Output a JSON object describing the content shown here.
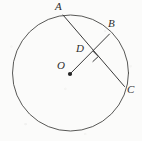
{
  "figure": {
    "type": "circle-geometry-diagram",
    "canvas": {
      "width": 142,
      "height": 141
    },
    "background_color": "#fbfbfa",
    "ink_color": "#3a3a3a",
    "circle": {
      "name": "main-circle",
      "center_label": "O",
      "cx": 70.5,
      "cy": 73.0,
      "r": 58.0,
      "stroke": "#4a4a48",
      "stroke_width": 1.0,
      "fill": "none"
    },
    "center_dot": {
      "name": "center-point-O",
      "cx": 70.0,
      "cy": 74.0,
      "r": 2.0,
      "fill": "#242424"
    },
    "points": [
      {
        "id": "A",
        "label": "A",
        "x": 63.0,
        "y": 15.0,
        "label_x": 55,
        "label_y": 1,
        "on_circle": true
      },
      {
        "id": "B",
        "label": "B",
        "x": 109.0,
        "y": 34.0,
        "label_x": 108,
        "label_y": 18,
        "on_circle": true
      },
      {
        "id": "C",
        "label": "C",
        "x": 124.0,
        "y": 86.0,
        "label_x": 127,
        "label_y": 84,
        "on_circle": true
      },
      {
        "id": "D",
        "label": "D",
        "x": 87.5,
        "y": 56.0,
        "label_x": 76,
        "label_y": 43,
        "on_circle": false
      },
      {
        "id": "O",
        "label": "O",
        "x": 70.0,
        "y": 74.0,
        "label_x": 57,
        "label_y": 60,
        "on_circle": false
      }
    ],
    "segments": [
      {
        "name": "chord-AC",
        "from": "A",
        "to": "C",
        "x1": 63.0,
        "y1": 15.0,
        "x2": 124.5,
        "y2": 86.5,
        "stroke": "#3a3a3a",
        "stroke_width": 1.0
      },
      {
        "name": "radius-OB",
        "from": "O",
        "to": "B",
        "x1": 70.0,
        "y1": 74.0,
        "x2": 109.5,
        "y2": 34.0,
        "stroke": "#3a3a3a",
        "stroke_width": 1.0
      }
    ],
    "right_angle_mark": {
      "name": "right-angle-mark-at-D",
      "vertex_x": 87.5,
      "vertex_y": 56.0,
      "size": 7.5,
      "stroke": "#3a3a3a",
      "stroke_width": 1.0,
      "description": "square marker indicating OB is perpendicular to AC at D"
    }
  }
}
